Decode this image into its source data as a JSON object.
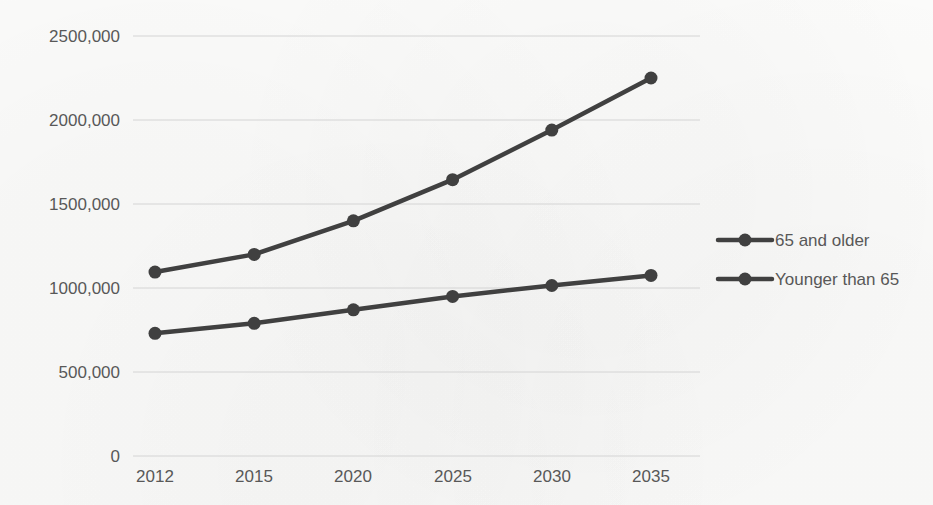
{
  "chart_data": {
    "type": "line",
    "title": "",
    "xlabel": "",
    "ylabel": "",
    "categories": [
      "2012",
      "2015",
      "2020",
      "2025",
      "2030",
      "2035"
    ],
    "series": [
      {
        "name": "65 and older",
        "color": "#404040",
        "values": [
          1095000,
          1200000,
          1400000,
          1645000,
          1940000,
          2250000
        ]
      },
      {
        "name": "Younger than 65",
        "color": "#404040",
        "values": [
          730000,
          790000,
          870000,
          950000,
          1015000,
          1075000
        ]
      }
    ],
    "ylim": [
      0,
      2500000
    ],
    "y_ticks": [
      0,
      500000,
      1000000,
      1500000,
      2000000,
      2500000
    ],
    "y_tick_labels": [
      "0",
      "500,000",
      "1000,000",
      "1500,000",
      "2000,000",
      "2500,000"
    ],
    "grid": true,
    "legend_position": "right",
    "legend": [
      "65 and older",
      "Younger than 65"
    ]
  },
  "legend": {
    "items": [
      {
        "label": "65 and older",
        "marker": "line-with-dot-marker"
      },
      {
        "label": "Younger than 65",
        "marker": "line-with-dot-marker"
      }
    ]
  },
  "colors": {
    "background": "#fbfbfa",
    "grid": "#d4d4d4",
    "text": "#585858",
    "series": "#404040"
  }
}
